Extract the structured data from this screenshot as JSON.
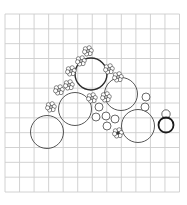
{
  "diagram": {
    "type": "planting-plan",
    "background": "#ffffff",
    "grid": {
      "x0": 5,
      "y0": 14,
      "x1": 179.5,
      "y1": 192,
      "cols": 12,
      "rows": 12,
      "color": "#cdcdcd",
      "stroke_width": 0.9
    },
    "large_circles": [
      {
        "id": "shrub-top",
        "cx": 91,
        "cy": 74,
        "r": 16,
        "stroke": "#2a2a2a",
        "stroke_width": 1.4
      },
      {
        "id": "shrub-right-upper",
        "cx": 121,
        "cy": 94,
        "r": 16.5,
        "stroke": "#444444",
        "stroke_width": 0.9
      },
      {
        "id": "shrub-left-middle",
        "cx": 75,
        "cy": 109,
        "r": 16.5,
        "stroke": "#444444",
        "stroke_width": 0.9
      },
      {
        "id": "shrub-right-lower",
        "cx": 138,
        "cy": 126,
        "r": 16.5,
        "stroke": "#444444",
        "stroke_width": 0.9
      },
      {
        "id": "shrub-bottom-left",
        "cx": 47,
        "cy": 132,
        "r": 16.5,
        "stroke": "#444444",
        "stroke_width": 0.9
      }
    ],
    "small_circles": [
      {
        "cx": 99,
        "cy": 107,
        "r": 4
      },
      {
        "cx": 96,
        "cy": 117,
        "r": 4
      },
      {
        "cx": 106,
        "cy": 116,
        "r": 4
      },
      {
        "cx": 115,
        "cy": 119,
        "r": 4
      },
      {
        "cx": 107,
        "cy": 126,
        "r": 4
      },
      {
        "cx": 146,
        "cy": 97,
        "r": 4
      },
      {
        "cx": 145,
        "cy": 107,
        "r": 4
      },
      {
        "cx": 166,
        "cy": 114,
        "r": 4.2
      }
    ],
    "bold_circles": [
      {
        "cx": 166,
        "cy": 125,
        "r": 7.5,
        "stroke": "#1a1a1a",
        "stroke_width": 1.8
      }
    ],
    "flower_clusters": [
      {
        "cx": 88,
        "cy": 51
      },
      {
        "cx": 81,
        "cy": 61
      },
      {
        "cx": 71,
        "cy": 71
      },
      {
        "cx": 69,
        "cy": 85
      },
      {
        "cx": 59,
        "cy": 90
      },
      {
        "cx": 51,
        "cy": 107
      },
      {
        "cx": 109,
        "cy": 69
      },
      {
        "cx": 118,
        "cy": 77
      },
      {
        "cx": 92,
        "cy": 98
      },
      {
        "cx": 106,
        "cy": 97
      },
      {
        "cx": 118,
        "cy": 133,
        "dark_center": true
      }
    ],
    "line_color": "#444444"
  }
}
